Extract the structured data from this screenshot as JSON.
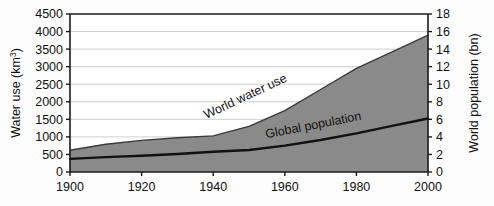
{
  "chart_data": {
    "type": "area",
    "title": "",
    "subtitle": "",
    "xlabel": "",
    "x": [
      1900,
      1910,
      1920,
      1930,
      1940,
      1950,
      1960,
      1970,
      1980,
      1990,
      2000
    ],
    "xlim": [
      1900,
      2000
    ],
    "xticks": [
      1900,
      1920,
      1940,
      1960,
      1980,
      2000
    ],
    "xticklabels": [
      "1900",
      "1920",
      "1940",
      "1960",
      "1980",
      "2000"
    ],
    "grid": true,
    "grid_orientation": "horizontal",
    "legend_position": "inline-annotations",
    "axes": [
      {
        "side": "left",
        "label": "Water use (km³)",
        "label_text": "Water use (km",
        "label_superscript": "3",
        "label_suffix": ")",
        "unit": "km³",
        "lim": [
          0,
          4500
        ],
        "ticks": [
          0,
          500,
          1000,
          1500,
          2000,
          2500,
          3000,
          3500,
          4000,
          4500
        ],
        "ticklabels": [
          "0",
          "500",
          "1000",
          "1500",
          "2000",
          "2500",
          "3000",
          "3500",
          "4000",
          "4500"
        ]
      },
      {
        "side": "right",
        "label": "World population (bn)",
        "unit": "bn",
        "lim": [
          0,
          18
        ],
        "ticks": [
          0,
          2,
          4,
          6,
          8,
          10,
          12,
          14,
          16,
          18
        ],
        "ticklabels": [
          "0",
          "2",
          "4",
          "6",
          "8",
          "10",
          "12",
          "14",
          "16",
          "18"
        ]
      }
    ],
    "series": [
      {
        "name": "World water use",
        "label": "World water use",
        "axis": "left",
        "render": "filled-area",
        "fill_color": "#8a8a8a",
        "line_color": "#3a3a3a",
        "unit": "km³",
        "values": [
          620,
          790,
          900,
          975,
          1030,
          1300,
          1750,
          2350,
          2950,
          3420,
          3900
        ]
      },
      {
        "name": "Global population",
        "label": "Global population",
        "axis": "right",
        "render": "line",
        "line_color": "#111111",
        "unit": "bn",
        "values": [
          1.5,
          1.7,
          1.85,
          2.05,
          2.3,
          2.5,
          3.0,
          3.65,
          4.4,
          5.25,
          6.1
        ]
      }
    ],
    "annotations": [
      {
        "name": "world-water-use-label",
        "text": "World water use",
        "x_px": 247,
        "y_px": 98,
        "rotation_deg": -25
      },
      {
        "name": "global-population-label",
        "text": "Global population",
        "x_px": 313,
        "y_px": 128,
        "rotation_deg": -11
      }
    ],
    "colors": {
      "area_fill": "#8a8a8a",
      "area_edge": "#3a3a3a",
      "population_line": "#111111",
      "gridline": "#c9c9c9",
      "axis": "#1a1a1a",
      "background": "#fdfdfd",
      "text": "#111111"
    }
  }
}
